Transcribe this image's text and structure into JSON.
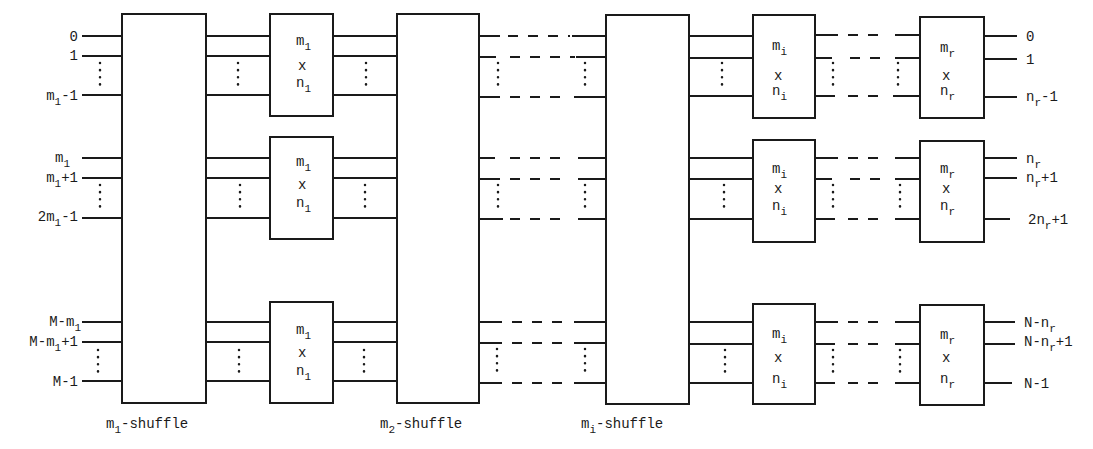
{
  "diagram": {
    "colors": {
      "ink": "#1a1a1a",
      "background": "#ffffff"
    },
    "stages": [
      {
        "id": "m1-shuffle",
        "label_main": "m",
        "label_sub": "1",
        "label_suffix": "-shuffle"
      },
      {
        "id": "m2-shuffle",
        "label_main": "m",
        "label_sub": "2",
        "label_suffix": "-shuffle"
      },
      {
        "id": "mi-shuffle",
        "label_main": "m",
        "label_sub": "i",
        "label_suffix": "-shuffle"
      }
    ],
    "switch_columns": [
      {
        "id": "m1xn1",
        "m": "m",
        "m_sub": "1",
        "x": "x",
        "n": "n",
        "n_sub": "1"
      },
      {
        "id": "mixni",
        "m": "m",
        "m_sub": "i",
        "x": "x",
        "n": "n",
        "n_sub": "i"
      },
      {
        "id": "mrxnr",
        "m": "m",
        "m_sub": "r",
        "x": "x",
        "n": "n",
        "n_sub": "r"
      }
    ],
    "inputs": [
      {
        "group": 1,
        "labels": [
          {
            "main": "0",
            "sub": "",
            "suffix": ""
          },
          {
            "main": "1",
            "sub": "",
            "suffix": ""
          },
          {
            "main": "m",
            "sub": "1",
            "suffix": "-1"
          }
        ]
      },
      {
        "group": 2,
        "labels": [
          {
            "main": "m",
            "sub": "1",
            "suffix": ""
          },
          {
            "main": "m",
            "sub": "1",
            "suffix": "+1"
          },
          {
            "main": "2m",
            "sub": "1",
            "suffix": "-1"
          }
        ]
      },
      {
        "group": 3,
        "labels": [
          {
            "main": "M-m",
            "sub": "1",
            "suffix": ""
          },
          {
            "main": "M-m",
            "sub": "1",
            "suffix": "+1"
          },
          {
            "main": "M-1",
            "sub": "",
            "suffix": ""
          }
        ]
      }
    ],
    "outputs": [
      {
        "group": 1,
        "labels": [
          {
            "main": "0",
            "sub": "",
            "suffix": ""
          },
          {
            "main": "1",
            "sub": "",
            "suffix": ""
          },
          {
            "main": "n",
            "sub": "r",
            "suffix": "-1"
          }
        ]
      },
      {
        "group": 2,
        "labels": [
          {
            "main": "n",
            "sub": "r",
            "suffix": ""
          },
          {
            "main": "n",
            "sub": "r",
            "suffix": "+1"
          },
          {
            "main": "2n",
            "sub": "r",
            "suffix": "+1"
          }
        ]
      },
      {
        "group": 3,
        "labels": [
          {
            "main": "N-n",
            "sub": "r",
            "suffix": ""
          },
          {
            "main": "N-n",
            "sub": "r",
            "suffix": "+1"
          },
          {
            "main": "N-1",
            "sub": "",
            "suffix": ""
          }
        ]
      }
    ]
  }
}
